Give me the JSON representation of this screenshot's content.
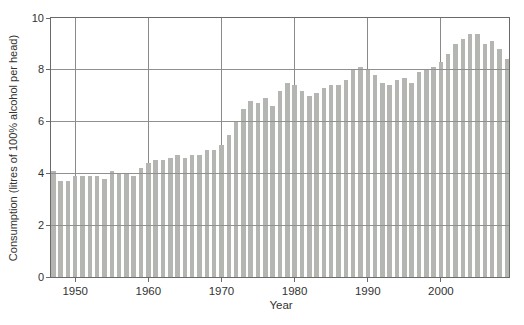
{
  "chart_data": {
    "type": "bar",
    "title": "",
    "xlabel": "Year",
    "ylabel": "Consumption (litres of 100% alcohol per head)",
    "ylim": [
      0,
      10
    ],
    "yticks": [
      0,
      2,
      4,
      6,
      8,
      10
    ],
    "ytick_labels": [
      "0",
      "2",
      "4",
      "6",
      "8",
      "10"
    ],
    "xticks": [
      1950,
      1960,
      1970,
      1980,
      1990,
      2000
    ],
    "xtick_labels": [
      "1950",
      "1960",
      "1970",
      "1980",
      "1990",
      "2000"
    ],
    "grid": "horizontal gridlines at 2,4,6,8 drawn across bars; vertical gridlines at decade ticks behind bars; full frame box",
    "legend": "none",
    "categories": [
      1947,
      1948,
      1949,
      1950,
      1951,
      1952,
      1953,
      1954,
      1955,
      1956,
      1957,
      1958,
      1959,
      1960,
      1961,
      1962,
      1963,
      1964,
      1965,
      1966,
      1967,
      1968,
      1969,
      1970,
      1971,
      1972,
      1973,
      1974,
      1975,
      1976,
      1977,
      1978,
      1979,
      1980,
      1981,
      1982,
      1983,
      1984,
      1985,
      1986,
      1987,
      1988,
      1989,
      1990,
      1991,
      1992,
      1993,
      1994,
      1995,
      1996,
      1997,
      1998,
      1999,
      2000,
      2001,
      2002,
      2003,
      2004,
      2005,
      2006,
      2007,
      2008,
      2009
    ],
    "values": [
      4.1,
      3.7,
      3.7,
      3.9,
      3.9,
      3.9,
      3.9,
      3.8,
      4.1,
      4.0,
      4.0,
      3.9,
      4.2,
      4.4,
      4.5,
      4.5,
      4.6,
      4.7,
      4.6,
      4.7,
      4.7,
      4.9,
      4.9,
      5.1,
      5.5,
      6.0,
      6.5,
      6.8,
      6.7,
      6.9,
      6.6,
      7.2,
      7.5,
      7.4,
      7.2,
      7.0,
      7.1,
      7.3,
      7.4,
      7.4,
      7.6,
      8.0,
      8.1,
      8.0,
      7.8,
      7.5,
      7.4,
      7.6,
      7.7,
      7.5,
      7.9,
      8.0,
      8.1,
      8.3,
      8.6,
      9.0,
      9.2,
      9.4,
      9.4,
      9.0,
      9.1,
      8.8,
      8.4
    ]
  },
  "colors": {
    "bar_fill": "#b3b6b1",
    "horizontal_grid": "#909090",
    "vertical_grid": "#8a8a8a",
    "frame": "#6a6a6a",
    "text": "#333333",
    "background": "#ffffff"
  }
}
